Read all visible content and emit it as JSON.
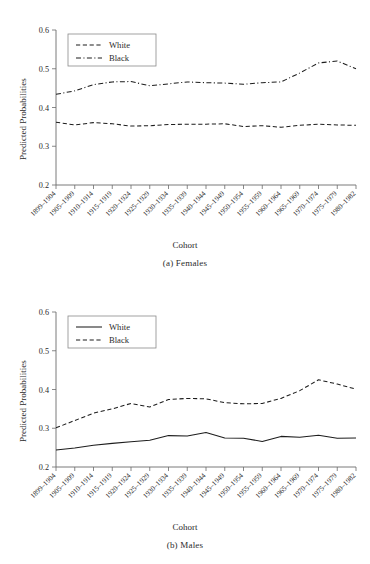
{
  "figure": {
    "panels": [
      {
        "id": "females",
        "caption": "(a) Females",
        "xlabel": "Cohort",
        "ylabel": "Predicted Probabilities",
        "legend": [
          {
            "label": "White",
            "dash": "dashed"
          },
          {
            "label": "Black",
            "dash": "dashdot"
          }
        ]
      },
      {
        "id": "males",
        "caption": "(b) Males",
        "xlabel": "Cohort",
        "ylabel": "Predicted Probabilities",
        "legend": [
          {
            "label": "White",
            "dash": "solid"
          },
          {
            "label": "Black",
            "dash": "dashed"
          }
        ]
      }
    ]
  },
  "chart_data": [
    {
      "type": "line",
      "title": "(a) Females",
      "xlabel": "Cohort",
      "ylabel": "Predicted Probabilities",
      "ylim": [
        0.2,
        0.6
      ],
      "yticks": [
        "0.2",
        "0.3",
        "0.4",
        "0.5",
        "0.6"
      ],
      "grid": false,
      "legend_position": "top-left",
      "categories": [
        "1899–1904",
        "1905–1909",
        "1910–1914",
        "1915–1919",
        "1920–1924",
        "1925–1929",
        "1930–1934",
        "1935–1939",
        "1940–1944",
        "1945–1949",
        "1950–1954",
        "1955–1959",
        "1960–1964",
        "1965–1969",
        "1970–1974",
        "1975–1979",
        "1980–1982"
      ],
      "series": [
        {
          "name": "White",
          "style": "dashed",
          "values": [
            0.362,
            0.355,
            0.361,
            0.358,
            0.352,
            0.353,
            0.356,
            0.357,
            0.357,
            0.358,
            0.351,
            0.353,
            0.349,
            0.354,
            0.357,
            0.355,
            0.354
          ]
        },
        {
          "name": "Black",
          "style": "dashdot",
          "values": [
            0.434,
            0.443,
            0.459,
            0.466,
            0.467,
            0.456,
            0.461,
            0.466,
            0.464,
            0.463,
            0.46,
            0.464,
            0.466,
            0.489,
            0.515,
            0.52,
            0.5
          ]
        }
      ]
    },
    {
      "type": "line",
      "title": "(b) Males",
      "xlabel": "Cohort",
      "ylabel": "Predicted Probabilities",
      "ylim": [
        0.2,
        0.6
      ],
      "yticks": [
        "0.2",
        "0.3",
        "0.4",
        "0.5",
        "0.6"
      ],
      "grid": false,
      "legend_position": "top-left",
      "categories": [
        "1899–1904",
        "1905–1909",
        "1910–1914",
        "1915–1919",
        "1920–1924",
        "1925–1929",
        "1930–1934",
        "1935–1939",
        "1940–1944",
        "1945–1949",
        "1950–1954",
        "1955–1959",
        "1960–1964",
        "1965–1969",
        "1970–1974",
        "1975–1979",
        "1980–1982"
      ],
      "series": [
        {
          "name": "White",
          "style": "solid",
          "values": [
            0.244,
            0.249,
            0.256,
            0.261,
            0.265,
            0.269,
            0.281,
            0.28,
            0.289,
            0.275,
            0.274,
            0.266,
            0.279,
            0.277,
            0.282,
            0.274,
            0.275
          ]
        },
        {
          "name": "Black",
          "style": "dashed",
          "values": [
            0.301,
            0.32,
            0.339,
            0.35,
            0.364,
            0.355,
            0.374,
            0.377,
            0.376,
            0.366,
            0.363,
            0.364,
            0.377,
            0.397,
            0.425,
            0.414,
            0.401
          ]
        }
      ]
    }
  ]
}
